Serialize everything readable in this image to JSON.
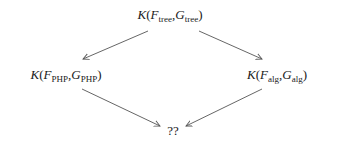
{
  "diagram": {
    "type": "commutative-diamond",
    "nodes": {
      "top": {
        "func": "K",
        "arg1": "F",
        "arg1_sub": "tree",
        "arg2": "G",
        "arg2_sub": "tree"
      },
      "left": {
        "func": "K",
        "arg1": "F",
        "arg1_sub": "PHP",
        "arg2": "G",
        "arg2_sub": "PHP"
      },
      "right": {
        "func": "K",
        "arg1": "F",
        "arg1_sub": "alg",
        "arg2": "G",
        "arg2_sub": "alg"
      },
      "bottom": {
        "label": "??"
      }
    },
    "edges": [
      {
        "from": "top",
        "to": "left"
      },
      {
        "from": "top",
        "to": "right"
      },
      {
        "from": "left",
        "to": "bottom"
      },
      {
        "from": "right",
        "to": "bottom"
      }
    ],
    "punct": {
      "open": "(",
      "comma": ",",
      "close": ")"
    },
    "colors": {
      "line": "#555555",
      "text": "#1a1a1a"
    }
  }
}
